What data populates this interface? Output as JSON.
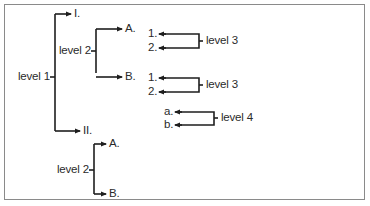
{
  "diagram": {
    "type": "outline-hierarchy",
    "colors": {
      "line": "#1e1e1e",
      "text": "#2a2a2a",
      "frame": "#8a8a8a",
      "background": "#ffffff"
    },
    "level1": {
      "label": "level 1"
    },
    "roman": [
      {
        "label": "I."
      },
      {
        "label": "II."
      }
    ],
    "upper_level2": {
      "label": "level 2",
      "items": [
        {
          "label": "A."
        },
        {
          "label": "B."
        }
      ]
    },
    "level3_groups": [
      {
        "label": "level 3",
        "items": [
          {
            "label": "1."
          },
          {
            "label": "2."
          }
        ]
      },
      {
        "label": "level 3",
        "items": [
          {
            "label": "1."
          },
          {
            "label": "2."
          }
        ]
      }
    ],
    "level4_group": {
      "label": "level 4",
      "items": [
        {
          "label": "a."
        },
        {
          "label": "b."
        }
      ]
    },
    "lower_level2": {
      "label": "level 2",
      "items": [
        {
          "label": "A."
        },
        {
          "label": "B."
        }
      ]
    }
  }
}
